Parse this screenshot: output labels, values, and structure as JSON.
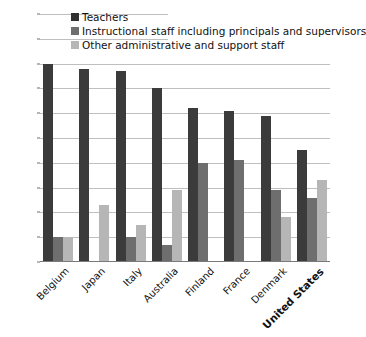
{
  "chart_data": {
    "type": "bar",
    "title": "",
    "subtitle": "",
    "xlabel": "",
    "ylabel": "",
    "ylim": [
      0,
      100
    ],
    "ytick_values": [
      0,
      10,
      20,
      30,
      40,
      50,
      60,
      70,
      80,
      90,
      100
    ],
    "ytick_labels": [
      "0",
      "10",
      "20",
      "30",
      "40",
      "50",
      "60",
      "70",
      "80",
      "90",
      "100%"
    ],
    "grid": true,
    "grid_axis": "y",
    "legend_position": "top-center",
    "categories": [
      "Belgium",
      "Japan",
      "Italy",
      "Australia",
      "Finland",
      "France",
      "Denmark",
      "United States"
    ],
    "highlighted_category": "United States",
    "series": [
      {
        "name": "Teachers",
        "color": "#3b3b3b",
        "values": [
          80,
          78,
          77,
          70,
          62,
          61,
          59,
          45
        ]
      },
      {
        "name": "Instructional staff including principals and supervisors",
        "color": "#6e6e6e",
        "values": [
          10,
          null,
          10,
          7,
          40,
          41,
          29,
          26
        ]
      },
      {
        "name": "Other administrative and support staff",
        "color": "#b6b6b6",
        "values": [
          10,
          23,
          15,
          29,
          null,
          null,
          18,
          33
        ]
      }
    ]
  },
  "axis": {
    "y_ticks": [
      {
        "label": "100%",
        "value": 100,
        "grid": "short"
      },
      {
        "label": "90",
        "value": 90,
        "grid": "short"
      },
      {
        "label": "80",
        "value": 80,
        "grid": "full"
      },
      {
        "label": "70",
        "value": 70,
        "grid": "full"
      },
      {
        "label": "60",
        "value": 60,
        "grid": "full"
      },
      {
        "label": "50",
        "value": 50,
        "grid": "full"
      },
      {
        "label": "40",
        "value": 40,
        "grid": "full"
      },
      {
        "label": "30",
        "value": 30,
        "grid": "full"
      },
      {
        "label": "20",
        "value": 20,
        "grid": "full"
      },
      {
        "label": "10",
        "value": 10,
        "grid": "full"
      },
      {
        "label": "0",
        "value": 0,
        "grid": "none"
      }
    ]
  },
  "legend": {
    "items": [
      {
        "label": "Teachers",
        "swatch": "s0"
      },
      {
        "label": "Instructional staff including principals and supervisors",
        "swatch": "s1"
      },
      {
        "label": "Other administrative and support staff",
        "swatch": "s2"
      }
    ]
  }
}
